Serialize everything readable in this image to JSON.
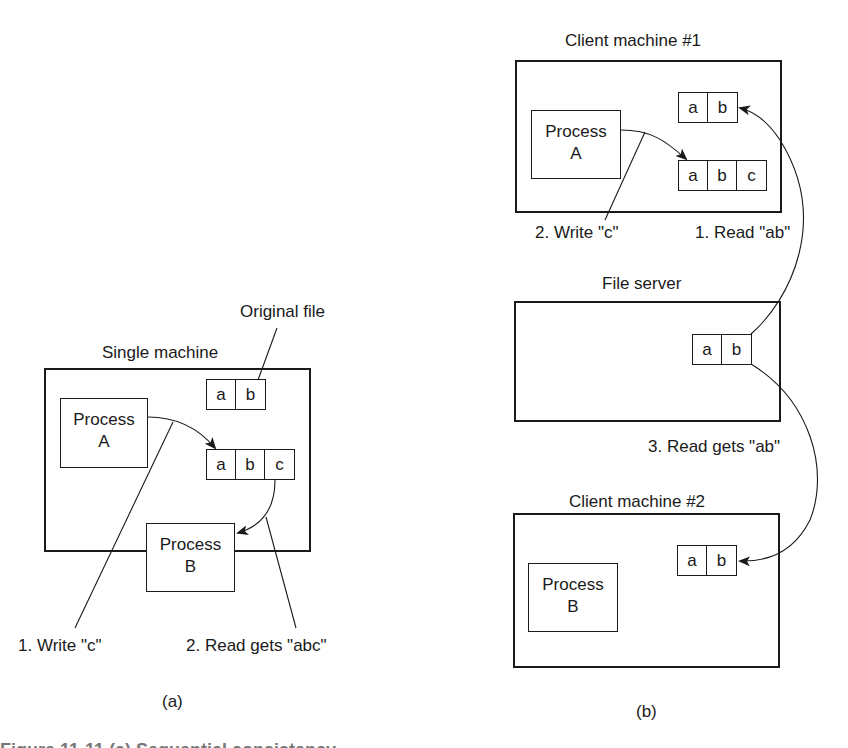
{
  "panel_a": {
    "caption": "(a)",
    "machine_label": "Single machine",
    "original_file_label": "Original file",
    "process_a": [
      "Process",
      "A"
    ],
    "process_b": [
      "Process",
      "B"
    ],
    "original_file_cells": [
      "a",
      "b"
    ],
    "modified_file_cells": [
      "a",
      "b",
      "c"
    ],
    "step1": "1. Write \"c\"",
    "step2": "2. Read gets \"abc\""
  },
  "panel_b": {
    "caption": "(b)",
    "client1_label": "Client machine #1",
    "server_label": "File server",
    "client2_label": "Client machine #2",
    "client1_process": [
      "Process",
      "A"
    ],
    "client2_process": [
      "Process",
      "B"
    ],
    "client1_cached_cells": [
      "a",
      "b"
    ],
    "client1_modified_cells": [
      "a",
      "b",
      "c"
    ],
    "server_file_cells": [
      "a",
      "b"
    ],
    "client2_cached_cells": [
      "a",
      "b"
    ],
    "step1": "1. Read \"ab\"",
    "step2": "2. Write \"c\"",
    "step3": "3. Read gets \"ab\""
  },
  "figure_caption_fragment": "Figure 11-11 (a) Sequential consistency"
}
